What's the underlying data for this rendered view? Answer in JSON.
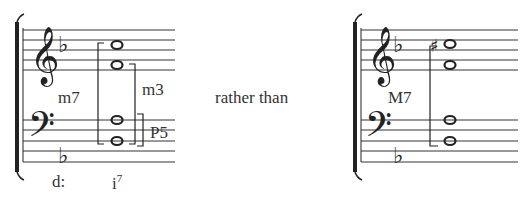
{
  "left_example": {
    "key": "d minor (one flat)",
    "chord_notes": [
      "D3",
      "A3",
      "F4",
      "C5"
    ],
    "interval_outer": "m7",
    "interval_upper": "m3",
    "interval_lower": "P5",
    "analysis_key": "d:",
    "analysis_chord": "i",
    "analysis_chord_sup": "7"
  },
  "connector": "rather than",
  "right_example": {
    "key": "one flat",
    "chord_notes": [
      "D3",
      "A3",
      "F4",
      "C#5"
    ],
    "accidental": "sharp",
    "interval_outer": "M7"
  },
  "colors": {
    "ink": "#222222",
    "background": "#ffffff"
  }
}
